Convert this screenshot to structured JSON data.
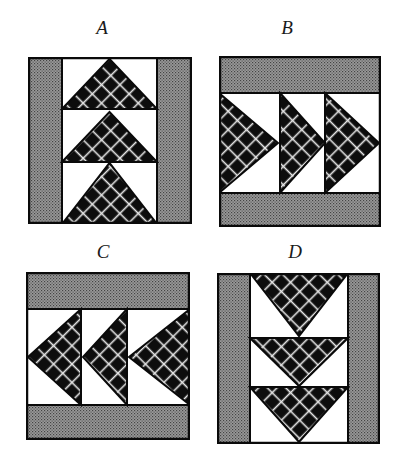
{
  "figure": {
    "colors": {
      "outline": "#0a0a0a",
      "bar_gray": "#8a8a8a",
      "bar_dot": "#4a4a4a",
      "triangle_dark": "#0d0d0d",
      "lattice_light": "#e8e8e8",
      "background": "#ffffff"
    },
    "options": [
      {
        "label": "A",
        "description": "Vertical flying-geese column, triangles pointing up, gray side bars",
        "orientation": "up",
        "label_pos": [
          102,
          18
        ],
        "box": [
          28,
          57,
          192,
          224
        ]
      },
      {
        "label": "B",
        "description": "Horizontal flying-geese row, triangles pointing right, gray top and bottom bars",
        "orientation": "right",
        "label_pos": [
          287,
          18
        ],
        "box": [
          219,
          56,
          381,
          227
        ]
      },
      {
        "label": "C",
        "description": "Horizontal flying-geese row, triangles pointing left, gray top and bottom bars",
        "orientation": "left",
        "label_pos": [
          103,
          242
        ],
        "box": [
          26,
          272,
          190,
          440
        ]
      },
      {
        "label": "D",
        "description": "Vertical flying-geese column, triangles pointing down, gray side bars",
        "orientation": "down",
        "label_pos": [
          295,
          242
        ],
        "box": [
          217,
          273,
          380,
          444
        ]
      }
    ]
  }
}
